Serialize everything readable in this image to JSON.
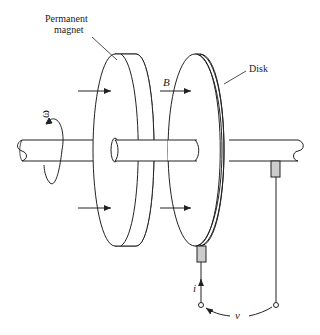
{
  "labels": {
    "magnet_line1": "Permanent",
    "magnet_line2": "magnet",
    "disk": "Disk",
    "field": "B",
    "omega": "ω",
    "current": "i",
    "voltage": "v"
  },
  "caption": "",
  "colors": {
    "line": "#222222",
    "brush": "#cccccc",
    "background": "#ffffff"
  }
}
